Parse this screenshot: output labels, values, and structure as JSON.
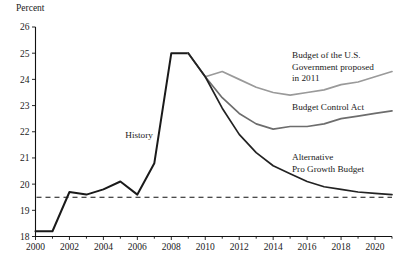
{
  "chart_data": {
    "type": "line",
    "title": "",
    "xlabel": "",
    "ylabel": "Percent",
    "xlim": [
      2000,
      2021
    ],
    "ylim": [
      18,
      26
    ],
    "yticks": [
      18,
      19,
      20,
      21,
      22,
      23,
      24,
      25,
      26
    ],
    "xticks": [
      2000,
      2002,
      2004,
      2006,
      2008,
      2010,
      2012,
      2014,
      2016,
      2018,
      2020
    ],
    "xticks_minor": [
      2001,
      2003,
      2005,
      2007,
      2009,
      2011,
      2013,
      2015,
      2017,
      2019,
      2021
    ],
    "grid": false,
    "legend_position": "inline-right",
    "reference_line": {
      "name": "historical-average",
      "value": 19.5,
      "style": "dashed"
    },
    "annotations": [
      {
        "name": "history",
        "text": "History",
        "x": 2006.1,
        "y": 21.75
      }
    ],
    "series": [
      {
        "name": "History",
        "label": "History",
        "color": "#1a1a1a",
        "width": 2.0,
        "x": [
          2000,
          2001,
          2002,
          2003,
          2004,
          2005,
          2006,
          2007,
          2008,
          2009
        ],
        "values": [
          18.2,
          18.2,
          19.7,
          19.6,
          19.8,
          20.1,
          19.6,
          20.8,
          25.0,
          25.0
        ]
      },
      {
        "name": "Budget of the U.S. Government proposed in 2011",
        "label": "Budget of the U.S.\nGovernment proposed\nin 2011",
        "label_lines": [
          "Budget of the U.S.",
          "Government proposed",
          "in 2011"
        ],
        "color": "#9a9a9a",
        "width": 1.7,
        "x": [
          2009,
          2010,
          2011,
          2012,
          2013,
          2014,
          2015,
          2016,
          2017,
          2018,
          2019,
          2020,
          2021
        ],
        "values": [
          25.0,
          24.1,
          24.3,
          24.0,
          23.7,
          23.5,
          23.4,
          23.5,
          23.6,
          23.8,
          23.9,
          24.1,
          24.3
        ]
      },
      {
        "name": "Budget Control Act",
        "label": "Budget Control Act",
        "color": "#6d6d6d",
        "width": 1.7,
        "x": [
          2009,
          2010,
          2011,
          2012,
          2013,
          2014,
          2015,
          2016,
          2017,
          2018,
          2019,
          2020,
          2021
        ],
        "values": [
          25.0,
          24.1,
          23.3,
          22.7,
          22.3,
          22.1,
          22.2,
          22.2,
          22.3,
          22.5,
          22.6,
          22.7,
          22.8
        ]
      },
      {
        "name": "Alternative Pro Growth Budget",
        "label": "Alternative\nPro Growth Budget",
        "label_lines": [
          "Alternative",
          "Pro Growth Budget"
        ],
        "color": "#222222",
        "width": 1.7,
        "x": [
          2009,
          2010,
          2011,
          2012,
          2013,
          2014,
          2015,
          2016,
          2017,
          2018,
          2019,
          2020,
          2021
        ],
        "values": [
          25.0,
          24.1,
          22.9,
          21.9,
          21.2,
          20.7,
          20.4,
          20.1,
          19.9,
          19.8,
          19.7,
          19.65,
          19.6
        ]
      }
    ],
    "series_labels": [
      {
        "name": "label-budget-us-government-2011",
        "lines": [
          "Budget of the U.S.",
          "Government proposed",
          "in 2011"
        ],
        "x": 292,
        "y": 58
      },
      {
        "name": "label-budget-control-act",
        "lines": [
          "Budget Control Act"
        ],
        "x": 292,
        "y": 110
      },
      {
        "name": "label-alternative-pro-growth-budget",
        "lines": [
          "Alternative",
          "Pro Growth Budget"
        ],
        "x": 292,
        "y": 160
      }
    ]
  }
}
